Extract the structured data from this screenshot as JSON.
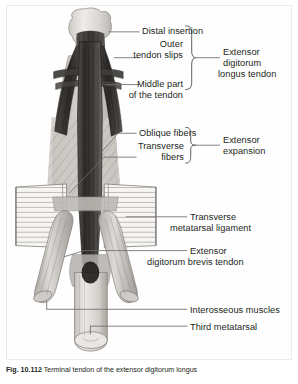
{
  "figure": {
    "caption_number": "Fig. 10.112",
    "caption_text": "Terminal tendon of the extensor digitorum longus"
  },
  "labels": {
    "distal_insertion": "Distal insertion",
    "outer_tendon_slips_l1": "Outer",
    "outer_tendon_slips_l2": "tendon slips",
    "middle_part_l1": "Middle part",
    "middle_part_l2": "of the tendon",
    "edl_tendon_l1": "Extensor",
    "edl_tendon_l2": "digitorum",
    "edl_tendon_l3": "longus tendon",
    "oblique_fibers": "Oblique fibers",
    "transverse_fibers_l1": "Transverse",
    "transverse_fibers_l2": "fibers",
    "extensor_expansion_l1": "Extensor",
    "extensor_expansion_l2": "expansion",
    "transverse_metatarsal_ligament_l1": "Transverse",
    "transverse_metatarsal_ligament_l2": "metatarsal ligament",
    "edb_tendon_l1": "Extensor",
    "edb_tendon_l2": "digitorum brevis tendon",
    "interosseous_muscles": "Interosseous muscles",
    "third_metatarsal": "Third metatarsal"
  },
  "colors": {
    "ink": "#231f20",
    "leader": "#6f6c6c",
    "bone_light": "#dcd9d6",
    "bone_mid": "#b8b4b0",
    "tendon_dark": "#3b3a38",
    "tendon_mid": "#6a6764",
    "expansion_fill": "#c9c6c2",
    "ligament_fill": "#f2f1ef",
    "plate_bg": "#fefefe",
    "frame": "#eceaea"
  }
}
